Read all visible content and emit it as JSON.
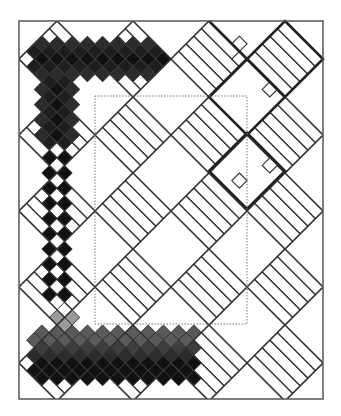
{
  "figure": {
    "title": "",
    "width": 341,
    "height": 416
  },
  "frame": {
    "x": 19,
    "y": 21,
    "w": 304,
    "h": 378,
    "stroke": "#555555"
  },
  "inner_dotted_rect": {
    "x": 95,
    "y": 96,
    "w": 152,
    "h": 228,
    "stroke": "#777777"
  },
  "lattice": {
    "origin_x": 57,
    "origin_y": 28.6,
    "step": 7.6,
    "cells_per_block": 5
  },
  "blocks": {
    "centers_x": [
      57,
      133,
      209,
      285
    ],
    "centers_y": [
      59,
      135,
      211,
      287,
      363
    ],
    "half_diagonal": 38,
    "grid_stroke": "#333333"
  },
  "thick_outlines": {
    "stroke": "#222222",
    "diamonds": [
      {
        "cx": 285,
        "cy": 59
      },
      {
        "cx": 247,
        "cy": 97
      },
      {
        "cx": 247,
        "cy": 171
      }
    ],
    "segments": [
      [
        [
          209,
          21
        ],
        [
          247,
          59
        ]
      ],
      [
        [
          247,
          59
        ],
        [
          209,
          97
        ]
      ]
    ]
  },
  "extra_cells": [
    {
      "c": 24,
      "r": 2
    },
    {
      "c": 24,
      "r": 4
    },
    {
      "c": 28,
      "r": 8
    },
    {
      "c": 24,
      "r": 20
    },
    {
      "c": 28,
      "r": 18
    }
  ],
  "shades": {
    "black": "#111111",
    "very_dark": "#1e1e1e",
    "dark": "#2c2c2c",
    "mid_dark": "#3e3e3e",
    "gray": "#5a5a5a",
    "light_gray": "#9a9a9a",
    "white": "#ffffff"
  },
  "bands": {
    "top_band": {
      "rows": [
        2,
        6
      ],
      "cols": [
        -3,
        14
      ],
      "row_shades": [
        "dark",
        "very_dark",
        "black",
        "very_dark",
        "dark"
      ]
    },
    "left_band_upper": {
      "rows": [
        7,
        15
      ],
      "cols": [
        -2,
        2
      ],
      "col_shades": [
        "dark",
        "very_dark",
        "black",
        "very_dark",
        "dark"
      ]
    },
    "checker_column": {
      "rows": [
        16,
        36
      ],
      "black_cols": [
        -1,
        1
      ],
      "white_cols": [
        0
      ]
    },
    "bottom_band": {
      "rows": [
        38,
        46
      ],
      "cols": [
        -3,
        19
      ],
      "row_shades": [
        "light_gray",
        "light_gray",
        "gray",
        "gray",
        "mid_dark",
        "dark",
        "black",
        "black",
        "black"
      ]
    }
  }
}
